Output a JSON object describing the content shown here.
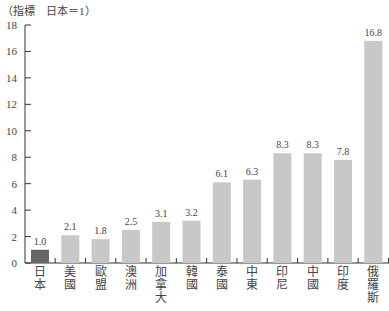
{
  "chart_data": {
    "type": "bar",
    "title": "",
    "unit_label": "（指標　日本＝1）",
    "xlabel": "",
    "ylabel": "指標 日本=1",
    "ylim": [
      0,
      18
    ],
    "yticks": [
      0,
      2,
      4,
      6,
      8,
      10,
      12,
      14,
      16,
      18
    ],
    "grid": false,
    "legend": null,
    "categories": [
      "日本",
      "美國",
      "歐盟",
      "澳洲",
      "加拿大",
      "韓國",
      "泰國",
      "中東",
      "印尼",
      "中國",
      "印度",
      "俄羅斯"
    ],
    "values": [
      1.0,
      2.1,
      1.8,
      2.5,
      3.1,
      3.2,
      6.1,
      6.3,
      8.3,
      8.3,
      7.8,
      16.8
    ],
    "value_labels": [
      "1.0",
      "2.1",
      "1.8",
      "2.5",
      "3.1",
      "3.2",
      "6.1",
      "6.3",
      "8.3",
      "8.3",
      "7.8",
      "16.8"
    ],
    "colors": {
      "highlight": "#666666",
      "default": "#c8c8c8",
      "axis": "#333333"
    },
    "highlight_index": 0
  }
}
